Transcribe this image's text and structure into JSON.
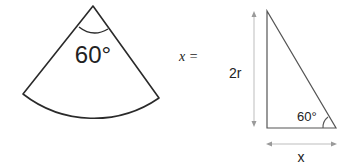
{
  "sector": {
    "angle_label": "60°",
    "stroke_color": "#2a2a2a"
  },
  "equation": {
    "text": "x ="
  },
  "triangle": {
    "angle_label": "60°",
    "side_label": "2r",
    "base_label": "x",
    "stroke_color": "#555555",
    "arrow_color": "#9a9a9a"
  }
}
